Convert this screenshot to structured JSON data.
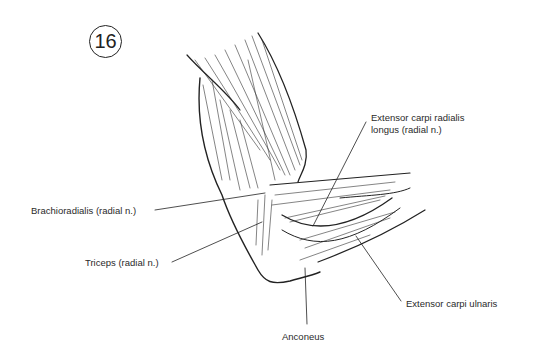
{
  "figure": {
    "number": "16"
  },
  "labels": [
    {
      "id": "brachioradialis",
      "text": "Brachioradialis (radial n.)"
    },
    {
      "id": "triceps",
      "text": "Triceps (radial n.)"
    },
    {
      "id": "ecrl_line1",
      "text": "Extensor carpi radialis"
    },
    {
      "id": "ecrl_line2",
      "text": "longus (radial n.)"
    },
    {
      "id": "ecu",
      "text": "Extensor carpi ulnaris"
    },
    {
      "id": "anconeus",
      "text": "Anconeus"
    }
  ],
  "colors": {
    "ink": "#222222",
    "background": "#ffffff"
  }
}
